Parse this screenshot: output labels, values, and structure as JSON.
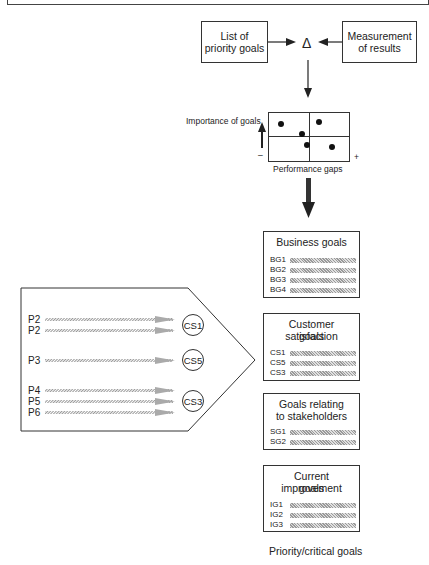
{
  "top_flow": {
    "left_box": "List of\npriority goals",
    "left_line1": "List of",
    "left_line2": "priority goals",
    "right_line1": "Measurement",
    "right_line2": "of results",
    "delta": "Δ"
  },
  "matrix": {
    "y_label": "Importance of goals",
    "x_label": "Performance gaps",
    "minus": "–",
    "plus": "+"
  },
  "goal_groups": [
    {
      "title_line1": "Business goals",
      "title_line2": "",
      "items": [
        "BG1",
        "BG2",
        "BG3",
        "BG4"
      ]
    },
    {
      "title_line1": "Customer satisfaction",
      "title_line2": "goals",
      "items": [
        "CS1",
        "CS5",
        "CS3"
      ]
    },
    {
      "title_line1": "Goals relating",
      "title_line2": "to stakeholders",
      "items": [
        "SG1",
        "SG2"
      ]
    },
    {
      "title_line1": "Current improvement",
      "title_line2": "goals",
      "items": [
        "IG1",
        "IG2",
        "IG3"
      ]
    }
  ],
  "footer_caption": "Priority/critical goals",
  "process_block": {
    "rows": [
      {
        "label": "P2"
      },
      {
        "label": "P2"
      },
      {
        "label": "P3"
      },
      {
        "label": "P4"
      },
      {
        "label": "P5"
      },
      {
        "label": "P6"
      }
    ],
    "circles": [
      "CS1",
      "CS5",
      "CS3"
    ]
  }
}
